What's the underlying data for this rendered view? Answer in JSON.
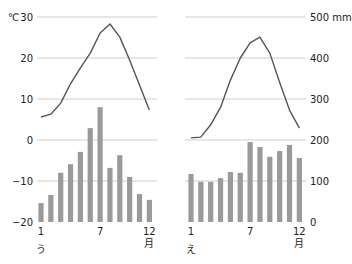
{
  "colors": {
    "bar": "#9a9a9a",
    "line": "#555555",
    "grid": "#cfcfcf",
    "text": "#222222"
  },
  "axes": {
    "temp_unit": "℃",
    "precip_unit": "mm",
    "temp_ticks": [
      30,
      20,
      10,
      0,
      -10,
      -20
    ],
    "precip_ticks": [
      500,
      400,
      300,
      200,
      100,
      0
    ],
    "month_ticks": [
      "1",
      "7",
      "12"
    ],
    "month_unit": "月"
  },
  "chart_data": [
    {
      "type": "bar+line",
      "label": "う",
      "categories": [
        1,
        2,
        3,
        4,
        5,
        6,
        7,
        8,
        9,
        10,
        11,
        12
      ],
      "xlabel": "月",
      "ylabel_left": "℃",
      "ylabel_right": "mm",
      "ylim_temp": [
        -20,
        30
      ],
      "ylim_precip": [
        0,
        500
      ],
      "grid": true,
      "series": [
        {
          "name": "temperature",
          "kind": "line",
          "unit": "℃",
          "values": [
            5.6,
            6.3,
            9.0,
            13.7,
            17.6,
            21.2,
            26.1,
            28.3,
            25.1,
            19.5,
            13.4,
            7.3
          ]
        },
        {
          "name": "precipitation",
          "kind": "bar",
          "unit": "mm",
          "values": [
            46,
            66,
            120,
            141,
            171,
            229,
            280,
            132,
            163,
            110,
            68,
            54
          ]
        }
      ]
    },
    {
      "type": "bar+line",
      "label": "え",
      "categories": [
        1,
        2,
        3,
        4,
        5,
        6,
        7,
        8,
        9,
        10,
        11,
        12
      ],
      "xlabel": "月",
      "ylabel_left": "℃",
      "ylabel_right": "mm",
      "ylim_temp": [
        -20,
        30
      ],
      "ylim_precip": [
        0,
        500
      ],
      "grid": true,
      "series": [
        {
          "name": "temperature",
          "kind": "line",
          "unit": "℃",
          "values": [
            0.5,
            0.7,
            3.7,
            8.0,
            14.6,
            20.0,
            23.7,
            25.1,
            21.2,
            14.1,
            7.3,
            2.9
          ]
        },
        {
          "name": "precipitation",
          "kind": "bar",
          "unit": "mm",
          "values": [
            117,
            98,
            98,
            107,
            122,
            120,
            195,
            183,
            159,
            173,
            188,
            156
          ]
        }
      ]
    }
  ]
}
